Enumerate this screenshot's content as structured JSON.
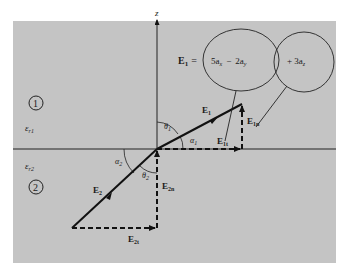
{
  "diagram": {
    "type": "boundary-condition-field-diagram",
    "colors": {
      "background": "#ffffff",
      "panel": "#c4c4c4",
      "line": "#111111"
    },
    "axis": {
      "label": "z"
    },
    "regions": [
      {
        "id": "1",
        "label": "1",
        "permittivity": "ε",
        "permittivity_sub": "r1"
      },
      {
        "id": "2",
        "label": "2",
        "permittivity": "ε",
        "permittivity_sub": "r2"
      }
    ],
    "equation": {
      "lhs": "E",
      "lhs_sub": "1",
      "equals": "=",
      "term1": "5a",
      "term1_sub": "x",
      "minus": "−",
      "term2": "2a",
      "term2_sub": "y",
      "term3": "+ 3a",
      "term3_sub": "z"
    },
    "vectors": {
      "E1": {
        "label": "E",
        "sub": "1"
      },
      "E1t": {
        "label": "E",
        "sub": "1t"
      },
      "E1n": {
        "label": "E",
        "sub": "1n"
      },
      "E2": {
        "label": "E",
        "sub": "2"
      },
      "E2t": {
        "label": "E",
        "sub": "2t"
      },
      "E2n": {
        "label": "E",
        "sub": "2n"
      }
    },
    "angles": {
      "theta1": {
        "label": "θ",
        "sub": "1"
      },
      "alpha1": {
        "label": "α",
        "sub": "1"
      },
      "theta2": {
        "label": "θ",
        "sub": "2"
      },
      "alpha2": {
        "label": "α",
        "sub": "2"
      }
    }
  }
}
